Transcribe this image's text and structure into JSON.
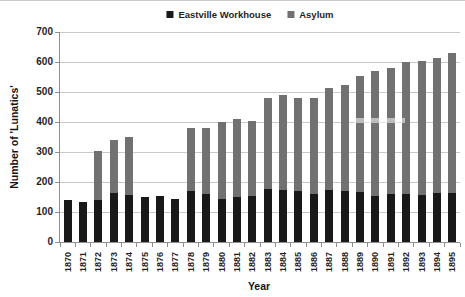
{
  "chart_data": {
    "type": "bar",
    "stacked": true,
    "title": "",
    "xlabel": "Year",
    "ylabel": "Number of 'Lunatics'",
    "ylim": [
      0,
      700
    ],
    "yticks": [
      0,
      100,
      200,
      300,
      400,
      500,
      600,
      700
    ],
    "grid": "horizontal",
    "legend_position": "top-center",
    "categories": [
      "1870",
      "1871",
      "1872",
      "1873",
      "1874",
      "1875",
      "1876",
      "1877",
      "1878",
      "1879",
      "1880",
      "1881",
      "1882",
      "1883",
      "1884",
      "1885",
      "1886",
      "1887",
      "1888",
      "1889",
      "1890",
      "1891",
      "1892",
      "1893",
      "1894",
      "1895"
    ],
    "series": [
      {
        "name": "Eastville Workhouse",
        "color": "#191919",
        "values": [
          140,
          133,
          140,
          163,
          158,
          150,
          155,
          145,
          170,
          160,
          145,
          150,
          153,
          177,
          175,
          170,
          160,
          175,
          170,
          168,
          155,
          160,
          160,
          157,
          165,
          165
        ]
      },
      {
        "name": "Asylum",
        "color": "#717171",
        "values": [
          0,
          0,
          165,
          177,
          192,
          0,
          0,
          0,
          210,
          220,
          255,
          260,
          252,
          303,
          315,
          310,
          320,
          340,
          355,
          387,
          415,
          420,
          440,
          448,
          450,
          465
        ]
      }
    ],
    "stacked_totals": [
      140,
      133,
      305,
      340,
      350,
      150,
      155,
      145,
      380,
      380,
      400,
      410,
      405,
      480,
      490,
      480,
      480,
      515,
      525,
      555,
      570,
      580,
      600,
      605,
      615,
      630
    ]
  }
}
